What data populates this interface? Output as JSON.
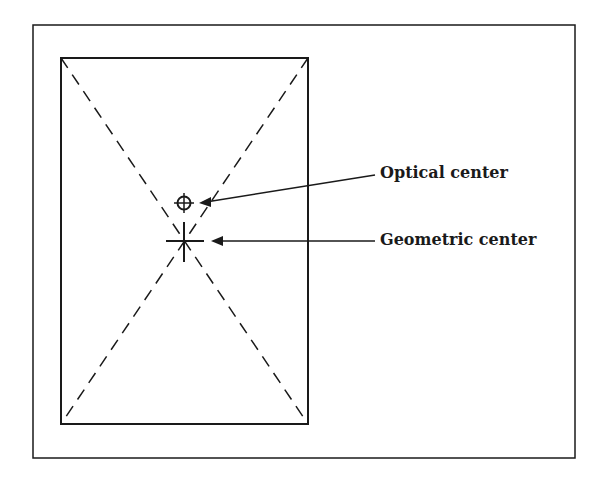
{
  "diagram": {
    "labels": {
      "optical": "Optical center",
      "geometric": "Geometric center"
    },
    "colors": {
      "ink": "#1a1a1a",
      "background": "#ffffff"
    }
  }
}
